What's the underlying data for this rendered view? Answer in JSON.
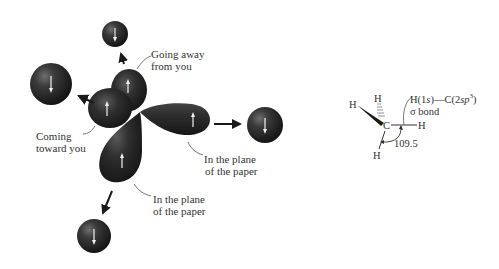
{
  "diagram": {
    "type": "sp3 orbital overlap with hydrogen 1s orbitals (methane formation)",
    "left_figure": {
      "central_atom_lobes": [
        {
          "id": "lobe-back",
          "orientation": "Going away from you",
          "electron_spin": "up"
        },
        {
          "id": "lobe-front",
          "orientation": "Coming toward you",
          "electron_spin": "up"
        },
        {
          "id": "lobe-right",
          "orientation": "In the plane of the paper",
          "electron_spin": "up"
        },
        {
          "id": "lobe-bottom",
          "orientation": "In the plane of the paper",
          "electron_spin": "up"
        }
      ],
      "hydrogen_spheres": [
        {
          "id": "h-top",
          "electron_spin": "down"
        },
        {
          "id": "h-left",
          "electron_spin": "down"
        },
        {
          "id": "h-right",
          "electron_spin": "down"
        },
        {
          "id": "h-bottom",
          "electron_spin": "down"
        }
      ],
      "labels": {
        "going_away_line1": "Going away",
        "going_away_line2": "from you",
        "coming_toward_line1": "Coming",
        "coming_toward_line2": "toward you",
        "plane_right_line1": "In the plane",
        "plane_right_line2": "of the paper",
        "plane_bottom_line1": "In the plane",
        "plane_bottom_line2": "of the paper"
      }
    },
    "right_figure": {
      "central_atom": "C",
      "hydrogens": [
        "H",
        "H",
        "H",
        "H"
      ],
      "bond_label_line1_prefix": "H(1",
      "bond_label_line1_s": "s",
      "bond_label_line1_mid": ")—C(2",
      "bond_label_line1_sp": "sp",
      "bond_label_line1_sup": "3",
      "bond_label_line1_suffix": ")",
      "bond_label_line2": "σ bond",
      "angle_label": "109.5"
    },
    "colors": {
      "orbital_dark": "#1c1c1c",
      "orbital_mid": "#3a3a3a",
      "orbital_highlight": "#6a6a6a",
      "arrow_white": "#f2f2f2",
      "text": "#333333",
      "background": "#ffffff"
    }
  }
}
